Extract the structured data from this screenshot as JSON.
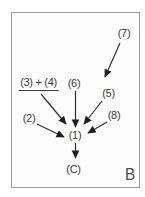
{
  "diagram": {
    "figure_label": "B",
    "nodes": {
      "seven": {
        "label": "(7)"
      },
      "five": {
        "label": "(5)"
      },
      "three_plus_four": {
        "label": "(3) + (4)"
      },
      "six": {
        "label": "(6)"
      },
      "two": {
        "label": "(2)"
      },
      "eight": {
        "label": "(8)"
      },
      "one": {
        "label": "(1)"
      },
      "c": {
        "label": "(C)"
      }
    },
    "edges": [
      {
        "from": "(7)",
        "to": "(5)"
      },
      {
        "from": "(3) + (4)",
        "to": "(1)"
      },
      {
        "from": "(6)",
        "to": "(1)"
      },
      {
        "from": "(5)",
        "to": "(1)"
      },
      {
        "from": "(2)",
        "to": "(1)"
      },
      {
        "from": "(8)",
        "to": "(1)"
      },
      {
        "from": "(1)",
        "to": "(C)"
      }
    ],
    "colors": {
      "background": "#ffffff",
      "frame_border": "#9a9a9a",
      "text": "#3b3b3b",
      "arrow": "#1f1f1f"
    }
  }
}
